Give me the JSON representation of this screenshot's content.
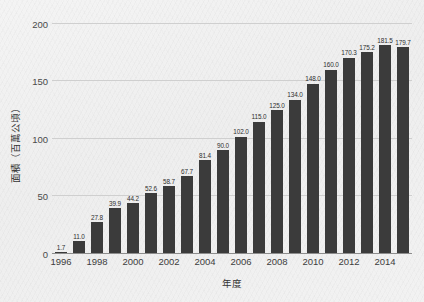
{
  "chart_data": {
    "type": "bar",
    "title": "",
    "xlabel": "年度",
    "ylabel": "面積（百萬公頃）",
    "categories": [
      "1996",
      "1997",
      "1998",
      "1999",
      "2000",
      "2001",
      "2002",
      "2003",
      "2004",
      "2005",
      "2006",
      "2007",
      "2008",
      "2009",
      "2010",
      "2011",
      "2012",
      "2013",
      "2014",
      "2015"
    ],
    "values": [
      1.7,
      11.0,
      27.8,
      39.9,
      44.2,
      52.6,
      58.7,
      67.7,
      81.4,
      90.0,
      102.0,
      115.0,
      125.0,
      134.0,
      148.0,
      160.0,
      170.3,
      175.2,
      181.5,
      179.7
    ],
    "data_labels": [
      "1.7",
      "11.0",
      "27.8",
      "39.9",
      "44.2",
      "52.6",
      "58.7",
      "67.7",
      "81.4",
      "90.0",
      "102.0",
      "115.0",
      "125.0",
      "134.0",
      "148.0",
      "160.0",
      "170.3",
      "175.2",
      "181.5",
      "179.7"
    ],
    "ylim": [
      0,
      205
    ],
    "yticks": [
      0,
      50,
      100,
      150,
      200
    ],
    "ytick_labels": [
      "0",
      "50",
      "100",
      "150",
      "200"
    ],
    "xtick_labels": [
      "1996",
      "1998",
      "2000",
      "2002",
      "2004",
      "2006",
      "2008",
      "2010",
      "2012",
      "2014"
    ],
    "xtick_categories": [
      "1996",
      "1998",
      "2000",
      "2002",
      "2004",
      "2006",
      "2008",
      "2010",
      "2012",
      "2014"
    ],
    "grid": true,
    "legend": "none",
    "bar_color": "#3b3b3b",
    "background_color": "#f1f1f1",
    "gridline_color": "#cfcfcf",
    "axis_color": "#8d8d8d",
    "label_color": "#2e2e2e"
  }
}
